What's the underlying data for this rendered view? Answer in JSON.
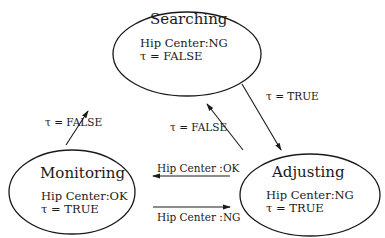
{
  "diagram": {
    "type": "state-transition",
    "states": [
      {
        "id": "searching",
        "name": "Searching",
        "hip_center": "Hip Center:NG",
        "tau": "τ = FALSE"
      },
      {
        "id": "monitoring",
        "name": "Monitoring",
        "hip_center": "Hip Center:OK",
        "tau": "τ = TRUE"
      },
      {
        "id": "adjusting",
        "name": "Adjusting",
        "hip_center": "Hip Center:NG",
        "tau": "τ = TRUE"
      }
    ],
    "transitions": [
      {
        "from": "monitoring",
        "to": "searching",
        "label": "τ = FALSE"
      },
      {
        "from": "searching",
        "to": "adjusting",
        "label": "τ = TRUE"
      },
      {
        "from": "adjusting",
        "to": "searching",
        "label": "τ = FALSE"
      },
      {
        "from": "adjusting",
        "to": "monitoring",
        "label": "Hip Center :OK"
      },
      {
        "from": "monitoring",
        "to": "adjusting",
        "label": "Hip Center :NG"
      }
    ]
  }
}
